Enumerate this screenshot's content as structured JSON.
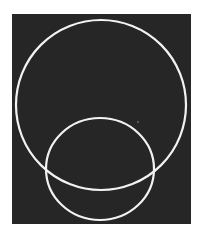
{
  "figure": {
    "background": {
      "x": 12,
      "y": 14,
      "width": 179,
      "height": 210,
      "color": "#262626"
    },
    "page_color": "#ffffff",
    "stroke_color": "#f2f2f2",
    "stroke_width": 2.2,
    "shapes": [
      {
        "id": "large-circle",
        "cx": 101,
        "cy": 105,
        "rx": 85,
        "ry": 85
      },
      {
        "id": "small-circle",
        "cx": 100,
        "cy": 169,
        "rx": 54,
        "ry": 51
      }
    ],
    "speck": {
      "cx": 138,
      "cy": 122,
      "r": 0.8,
      "color": "#9a9a9a"
    }
  }
}
